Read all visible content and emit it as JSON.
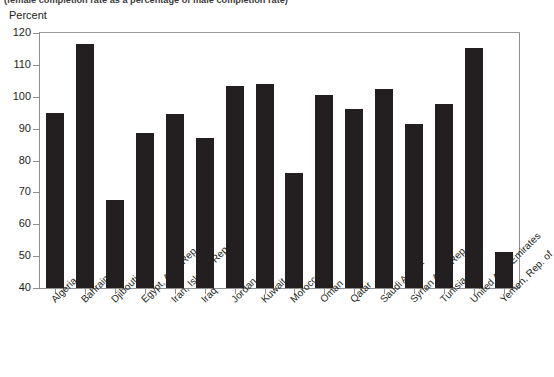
{
  "figure": {
    "subtitle": "(female completion rate as a percentage of male completion rate)",
    "axis_title": "Percent"
  },
  "colors": {
    "bar": "#231f20",
    "axis": "#8f8f8f",
    "text": "#231f20",
    "background": "#ffffff"
  },
  "chart_data": {
    "type": "bar",
    "title": "",
    "subtitle": "(female completion rate as a percentage of male completion rate)",
    "xlabel": "",
    "ylabel": "Percent",
    "ylim": [
      40,
      120
    ],
    "yticks": [
      40,
      50,
      60,
      70,
      80,
      90,
      100,
      110,
      120
    ],
    "ytick_labels": [
      "40",
      "50",
      "60",
      "70",
      "80",
      "90",
      "100",
      "110",
      "120"
    ],
    "grid": false,
    "legend": null,
    "categories": [
      "Algeria",
      "Bahrain",
      "Djibouti",
      "Egypt, Arab Rep. of",
      "Iran, Islamic Rep. of",
      "Iraq",
      "Jordan",
      "Kuwait",
      "Morocco",
      "Oman",
      "Qatar",
      "Saudi Arabia",
      "Syrian Arab Rep.",
      "Tunisia",
      "United Arab Emirates",
      "Yemen, Rep. of"
    ],
    "values": [
      94.8,
      116.5,
      67.5,
      88.7,
      94.7,
      87.0,
      103.5,
      104.0,
      76.0,
      100.6,
      96.3,
      102.5,
      91.5,
      97.6,
      115.3,
      51.3
    ]
  }
}
